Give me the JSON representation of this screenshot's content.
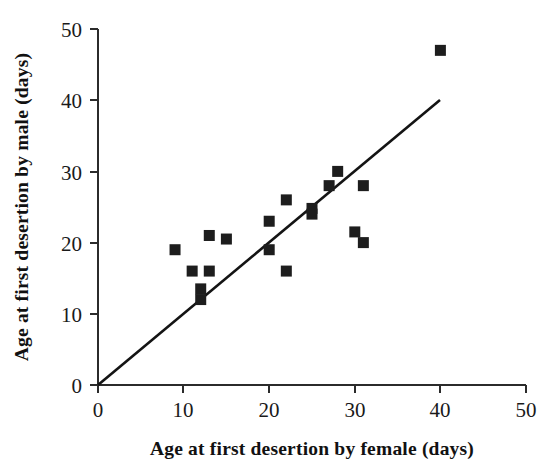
{
  "chart_data": {
    "type": "scatter",
    "title": "",
    "xlabel": "Age at first desertion by female (days)",
    "ylabel": "Age at first desertion by male (days)",
    "xlim": [
      0,
      50
    ],
    "ylim": [
      0,
      50
    ],
    "xticks": [
      0,
      10,
      20,
      30,
      40,
      50
    ],
    "yticks": [
      0,
      10,
      20,
      30,
      40,
      50
    ],
    "xtick_labels": [
      "0",
      "10",
      "20",
      "30",
      "40",
      "50"
    ],
    "ytick_labels": [
      "0",
      "10",
      "20",
      "30",
      "40",
      "50"
    ],
    "grid": false,
    "legend": null,
    "marker": "filled-square",
    "marker_color": "#1d1d1d",
    "points": [
      {
        "x": 9,
        "y": 19
      },
      {
        "x": 11,
        "y": 16
      },
      {
        "x": 12,
        "y": 13.5
      },
      {
        "x": 12,
        "y": 12
      },
      {
        "x": 13,
        "y": 21
      },
      {
        "x": 13,
        "y": 16
      },
      {
        "x": 15,
        "y": 20.5
      },
      {
        "x": 20,
        "y": 23
      },
      {
        "x": 20,
        "y": 19
      },
      {
        "x": 22,
        "y": 26
      },
      {
        "x": 22,
        "y": 16
      },
      {
        "x": 25,
        "y": 24.8
      },
      {
        "x": 25,
        "y": 24
      },
      {
        "x": 27,
        "y": 28
      },
      {
        "x": 28,
        "y": 30
      },
      {
        "x": 30,
        "y": 21.5
      },
      {
        "x": 31,
        "y": 28
      },
      {
        "x": 31,
        "y": 20
      },
      {
        "x": 40,
        "y": 47
      }
    ],
    "series": [
      {
        "name": "observations",
        "x": [
          9,
          11,
          12,
          12,
          13,
          13,
          15,
          20,
          20,
          22,
          22,
          25,
          25,
          27,
          28,
          30,
          31,
          31,
          40
        ],
        "values": [
          19,
          16,
          13.5,
          12,
          21,
          16,
          20.5,
          23,
          19,
          26,
          16,
          24.8,
          24,
          28,
          30,
          21.5,
          28,
          20,
          47
        ]
      }
    ],
    "reference_line": {
      "label": "line of equality",
      "from": {
        "x": 0,
        "y": 0
      },
      "to": {
        "x": 40,
        "y": 40
      },
      "color": "#141414"
    }
  },
  "axes": {
    "x": {
      "title": "Age at first desertion by female (days)",
      "tick_labels": [
        "0",
        "10",
        "20",
        "30",
        "40",
        "50"
      ]
    },
    "y": {
      "title": "Age at first desertion by male (days)",
      "tick_labels": [
        "0",
        "10",
        "20",
        "30",
        "40",
        "50"
      ]
    }
  }
}
